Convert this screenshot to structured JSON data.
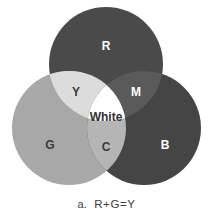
{
  "figure": {
    "type": "venn-diagram-3-circle",
    "background_color": "#ffffff"
  },
  "circles": [
    {
      "key": "red",
      "label": "R",
      "cx": 106,
      "cy": 64,
      "r": 57,
      "fill": "#4a4a4a",
      "label_x": 106,
      "label_y": 47,
      "label_class": "label-on-dark",
      "label_size": 12
    },
    {
      "key": "green",
      "label": "G",
      "cx": 69,
      "cy": 128,
      "r": 57,
      "fill": "#a8a8a8",
      "label_x": 50,
      "label_y": 146,
      "label_class": "label-on-light",
      "label_size": 12
    },
    {
      "key": "blue",
      "label": "B",
      "cx": 144,
      "cy": 128,
      "r": 57,
      "fill": "#454545",
      "label_x": 165,
      "label_y": 146,
      "label_class": "label-on-dark",
      "label_size": 12
    }
  ],
  "intersections": [
    {
      "key": "yellow",
      "label": "Y",
      "of": "R+G",
      "fill": "#dcdcdc",
      "label_x": 76,
      "label_y": 93,
      "label_class": "label-on-light",
      "label_size": 12
    },
    {
      "key": "magenta",
      "label": "M",
      "of": "R+B",
      "fill": "#5a5a5a",
      "label_x": 136,
      "label_y": 93,
      "label_class": "label-on-dark",
      "label_size": 12
    },
    {
      "key": "cyan",
      "label": "C",
      "of": "G+B",
      "fill": "#b5b5b5",
      "label_x": 106,
      "label_y": 148,
      "label_class": "label-on-light",
      "label_size": 12
    },
    {
      "key": "white",
      "label": "White",
      "of": "R+G+B",
      "fill": "#ffffff",
      "label_x": 106,
      "label_y": 118,
      "label_class": "label-center",
      "label_size": 12
    }
  ],
  "caption": {
    "marker": "a.",
    "text": "R+G=Y",
    "color": "#3d3d3d"
  }
}
